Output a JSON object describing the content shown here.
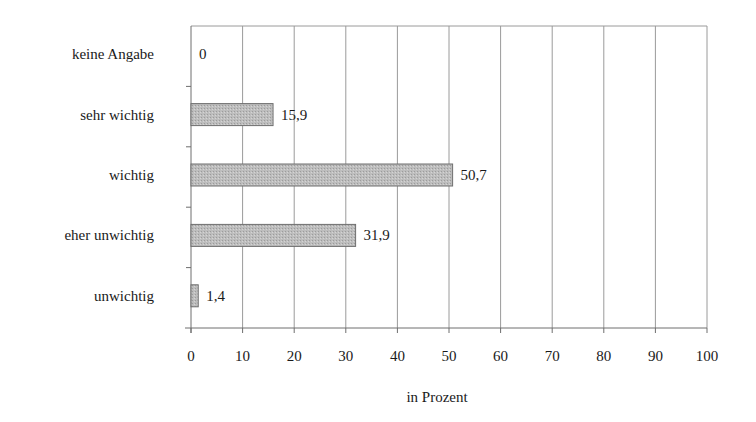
{
  "chart_data": {
    "type": "bar",
    "orientation": "horizontal",
    "title": "",
    "xlabel": "in Prozent",
    "ylabel": "",
    "categories": [
      "keine Angabe",
      "sehr wichtig",
      "wichtig",
      "eher unwichtig",
      "unwichtig"
    ],
    "values": [
      0,
      15.9,
      50.7,
      31.9,
      1.4
    ],
    "value_labels": [
      "0",
      "15,9",
      "50,7",
      "31,9",
      "1,4"
    ],
    "xlim": [
      0,
      100
    ],
    "xticks": [
      0,
      10,
      20,
      30,
      40,
      50,
      60,
      70,
      80,
      90,
      100
    ],
    "xtick_labels": [
      "0",
      "10",
      "20",
      "30",
      "40",
      "50",
      "60",
      "70",
      "80",
      "90",
      "100"
    ],
    "grid": "vertical",
    "legend": "none",
    "colors": {
      "bar_fill": "#b4b4b4",
      "bar_stroke": "#6e6e6e",
      "grid": "#9a9a9a",
      "axis": "#6e6e6e",
      "text": "#1a1a1a"
    }
  }
}
